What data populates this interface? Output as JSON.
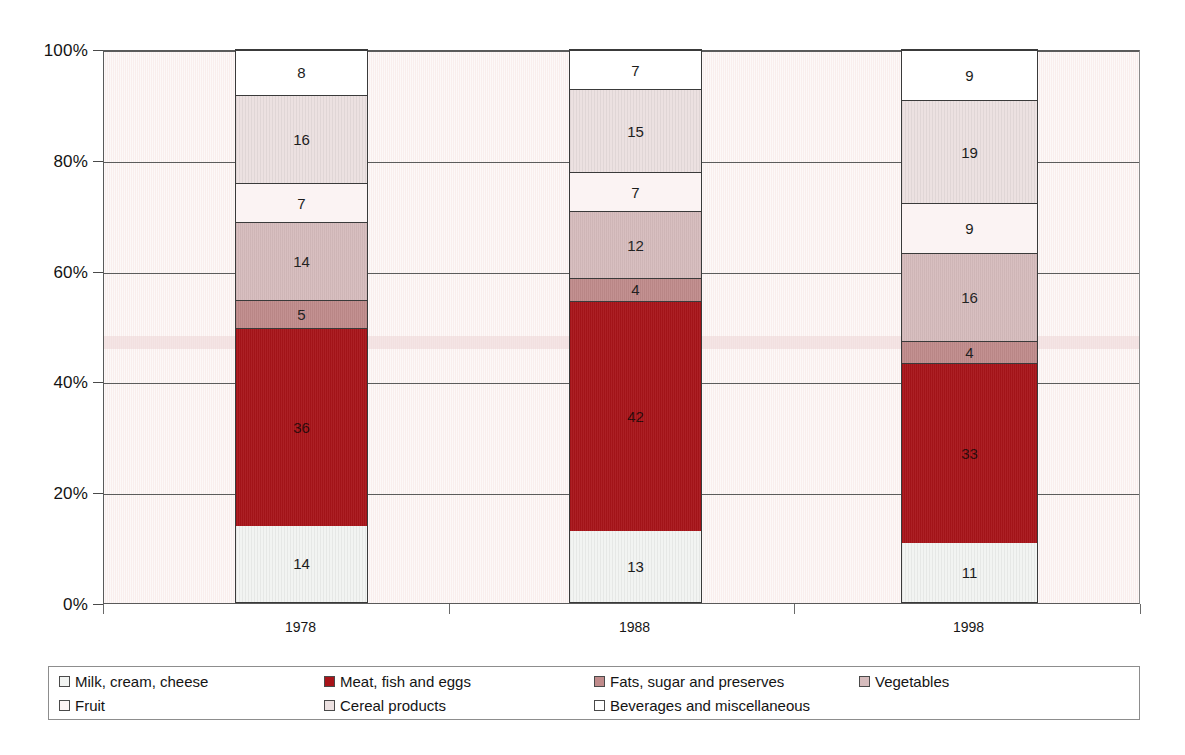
{
  "chart_data": {
    "type": "bar",
    "subtype": "100% stacked column",
    "title": "",
    "subtitle": "",
    "xlabel": "",
    "ylabel": "",
    "categories": [
      "1978",
      "1988",
      "1998"
    ],
    "ylim": [
      0,
      100
    ],
    "y_unit": "%",
    "y_ticks": [
      "0%",
      "20%",
      "40%",
      "60%",
      "80%",
      "100%"
    ],
    "y_tick_values": [
      0,
      20,
      40,
      60,
      80,
      100
    ],
    "grid": "horizontal",
    "legend_position": "bottom",
    "stack_order": "bottom-to-top",
    "series": [
      {
        "name": "Milk, cream, cheese",
        "color": "#f2f4f2",
        "values": [
          14,
          13,
          11
        ],
        "labels": [
          "14",
          "13",
          "11"
        ]
      },
      {
        "name": "Meat, fish and eggs",
        "color": "#a81419",
        "values": [
          36,
          42,
          33
        ],
        "labels": [
          "36",
          "42",
          "33"
        ]
      },
      {
        "name": "Fats, sugar and preserves",
        "color": "#c08b8b",
        "values": [
          5,
          4,
          4
        ],
        "labels": [
          "5",
          "4",
          "4"
        ]
      },
      {
        "name": "Vegetables",
        "color": "#d6bcbd",
        "values": [
          14,
          12,
          16
        ],
        "labels": [
          "14",
          "12",
          "16"
        ]
      },
      {
        "name": "Fruit",
        "color": "#fbf3f3",
        "values": [
          7,
          7,
          9
        ],
        "labels": [
          "7",
          "7",
          "9"
        ]
      },
      {
        "name": "Cereal products",
        "color": "#ece1e1",
        "values": [
          16,
          15,
          19
        ],
        "labels": [
          "16",
          "15",
          "19"
        ]
      },
      {
        "name": "Beverages and miscellaneous",
        "color": "#ffffff",
        "values": [
          8,
          7,
          9
        ],
        "labels": [
          "8",
          "7",
          "9"
        ]
      }
    ]
  },
  "axis": {
    "y_ticks": [
      {
        "label": "100%",
        "value": 100
      },
      {
        "label": "80%",
        "value": 80
      },
      {
        "label": "60%",
        "value": 60
      },
      {
        "label": "40%",
        "value": 40
      },
      {
        "label": "20%",
        "value": 20
      },
      {
        "label": "0%",
        "value": 0
      }
    ],
    "x_labels": [
      "1978",
      "1988",
      "1998"
    ]
  },
  "legend": {
    "items": [
      {
        "label": "Milk, cream, cheese",
        "color": "#f2f4f2"
      },
      {
        "label": "Meat, fish and eggs",
        "color": "#a81419"
      },
      {
        "label": "Fats, sugar and preserves",
        "color": "#c08b8b"
      },
      {
        "label": "Vegetables",
        "color": "#d6bcbd"
      },
      {
        "label": "Fruit",
        "color": "#fbf3f3"
      },
      {
        "label": "Cereal products",
        "color": "#ece1e1"
      },
      {
        "label": "Beverages and miscellaneous",
        "color": "#ffffff"
      }
    ]
  },
  "colors": {
    "plot_background": "#faf1f0",
    "gridline": "#5c5c5c",
    "axis_line": "#5a5a5a",
    "bar_outline": "#3a3a3a",
    "legend_border": "#8d8d8d",
    "text": "#141414"
  }
}
